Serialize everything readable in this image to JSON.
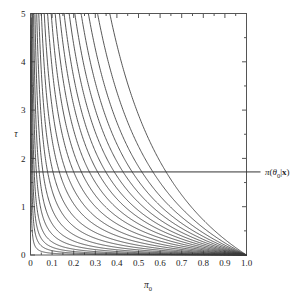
{
  "figure": {
    "title": "",
    "background_color": "#ffffff",
    "line_color": "#3a3a3a",
    "axis_color": "#555555"
  },
  "annotation": {
    "name": "posterior-reference-label",
    "text": "π(θ₀|x)",
    "pi": "π",
    "open_paren": "(",
    "theta": "θ",
    "theta_sub": "0",
    "bar": "|",
    "x_bold": "x",
    "close_paren": ")",
    "tau_value": 1.72
  },
  "chart_data": {
    "type": "line",
    "title": "",
    "xlabel": "π₀",
    "ylabel": "τ",
    "xlim": [
      0,
      1.0
    ],
    "ylim": [
      0,
      5
    ],
    "grid": false,
    "legend": "none",
    "xticks": [
      0,
      0.1,
      0.2,
      0.3,
      0.4,
      0.5,
      0.6,
      0.7,
      0.8,
      0.9,
      1.0
    ],
    "xticklabels": [
      "0",
      "0.1",
      "0.2",
      "0.3",
      "0.4",
      "0.5",
      "0.6",
      "0.7",
      "0.8",
      "0.9",
      "1.0"
    ],
    "yticks": [
      0,
      1,
      2,
      3,
      4,
      5
    ],
    "yticklabels": [
      "0",
      "1",
      "2",
      "3",
      "4",
      "5"
    ],
    "minor_xticks": [
      0.05,
      0.15,
      0.25,
      0.35,
      0.45,
      0.55,
      0.65,
      0.75,
      0.85,
      0.95
    ],
    "minor_yticks": [
      0.5,
      1.5,
      2.5,
      3.5,
      4.5
    ],
    "hline": {
      "y": 1.72,
      "label": "π(θ₀|x)"
    },
    "series_note": "family of curves all converging at (1.0, 0); each curve indexed by a constant k",
    "series": [
      {
        "name": "k01",
        "k": 0.004,
        "values": []
      },
      {
        "name": "k02",
        "k": 0.01,
        "values": []
      },
      {
        "name": "k03",
        "k": 0.018,
        "values": []
      },
      {
        "name": "k04",
        "k": 0.03,
        "values": []
      },
      {
        "name": "k05",
        "k": 0.048,
        "values": []
      },
      {
        "name": "k06",
        "k": 0.072,
        "values": []
      },
      {
        "name": "k07",
        "k": 0.105,
        "values": []
      },
      {
        "name": "k08",
        "k": 0.148,
        "values": []
      },
      {
        "name": "k09",
        "k": 0.2,
        "values": []
      },
      {
        "name": "k10",
        "k": 0.265,
        "values": []
      },
      {
        "name": "k11",
        "k": 0.34,
        "values": []
      },
      {
        "name": "k12",
        "k": 0.43,
        "values": []
      },
      {
        "name": "k13",
        "k": 0.53,
        "values": []
      },
      {
        "name": "k14",
        "k": 0.645,
        "values": []
      },
      {
        "name": "k15",
        "k": 0.775,
        "values": []
      },
      {
        "name": "k16",
        "k": 0.92,
        "values": []
      },
      {
        "name": "k17",
        "k": 1.09,
        "values": []
      },
      {
        "name": "k18",
        "k": 1.29,
        "values": []
      },
      {
        "name": "k19",
        "k": 1.53,
        "values": []
      },
      {
        "name": "k20",
        "k": 1.83,
        "values": []
      },
      {
        "name": "k21",
        "k": 2.25,
        "values": []
      },
      {
        "name": "k22",
        "k": 2.9,
        "values": []
      }
    ],
    "x_at_hline": [
      0.02,
      0.045,
      0.075,
      0.105,
      0.14,
      0.185,
      0.235,
      0.29,
      0.345,
      0.4,
      0.455,
      0.515,
      0.575,
      0.635,
      0.7,
      0.765,
      0.83,
      0.89,
      0.945,
      0.98
    ],
    "x_at_top": [
      0.005,
      0.012,
      0.022,
      0.035,
      0.055,
      0.085,
      0.125,
      0.17,
      0.225,
      0.285,
      0.35,
      0.415,
      0.48,
      0.55,
      0.62,
      0.69,
      0.765,
      0.84,
      0.9,
      0.955
    ],
    "x_at_bottom": [
      0.09,
      0.205,
      0.31,
      0.41,
      0.505,
      0.59,
      0.665,
      0.735,
      0.79,
      0.84,
      0.88,
      0.915,
      0.94,
      0.96,
      0.975,
      0.985,
      0.992,
      0.996,
      0.999,
      1.0
    ]
  }
}
